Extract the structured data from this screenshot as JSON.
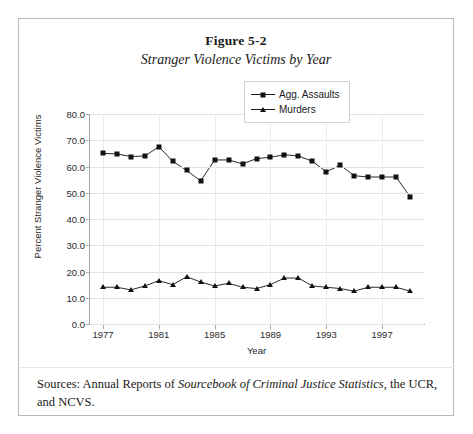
{
  "figure": {
    "number": "Figure 5-2",
    "subtitle": "Stranger Violence Victims by Year"
  },
  "source_note": {
    "prefix": "Sources: Annual Reports of ",
    "italic": "Sourcebook of Criminal Justice Statistics,",
    "suffix": " the UCR, and NCVS."
  },
  "chart_data": {
    "type": "line",
    "title": "Stranger Violence Victims by Year",
    "xlabel": "Year",
    "ylabel": "Percent Stranger Violence Victims",
    "xlim": [
      1976,
      2000
    ],
    "ylim": [
      0,
      80
    ],
    "ytick_labels": [
      "0.0",
      "10.0",
      "20.0",
      "30.0",
      "40.0",
      "50.0",
      "60.0",
      "70.0",
      "80.0"
    ],
    "ytick_values": [
      0,
      10,
      20,
      30,
      40,
      50,
      60,
      70,
      80
    ],
    "xtick_labels": [
      "1977",
      "1981",
      "1985",
      "1989",
      "1993",
      "1997"
    ],
    "xtick_values": [
      1977,
      1981,
      1985,
      1989,
      1993,
      1997
    ],
    "grid": true,
    "legend_position": "top-right",
    "x": [
      1977,
      1978,
      1979,
      1980,
      1981,
      1982,
      1983,
      1984,
      1985,
      1986,
      1987,
      1988,
      1989,
      1990,
      1991,
      1992,
      1993,
      1994,
      1995,
      1996,
      1997,
      1998,
      1999
    ],
    "series": [
      {
        "name": "Agg. Assaults",
        "marker": "square",
        "color": "#111111",
        "values": [
          65.0,
          64.8,
          63.8,
          64.0,
          67.5,
          62.0,
          58.5,
          54.5,
          62.5,
          62.5,
          61.0,
          63.0,
          63.5,
          64.5,
          64.0,
          62.0,
          58.0,
          60.5,
          56.5,
          56.0,
          56.0,
          56.0,
          48.5
        ]
      },
      {
        "name": "Murders",
        "marker": "triangle",
        "color": "#111111",
        "values": [
          14.0,
          14.0,
          13.0,
          14.5,
          16.5,
          15.0,
          18.0,
          16.0,
          14.5,
          15.5,
          14.0,
          13.5,
          15.0,
          17.5,
          17.5,
          14.5,
          14.0,
          13.5,
          12.5,
          14.0,
          14.0,
          14.0,
          12.5
        ]
      }
    ]
  }
}
